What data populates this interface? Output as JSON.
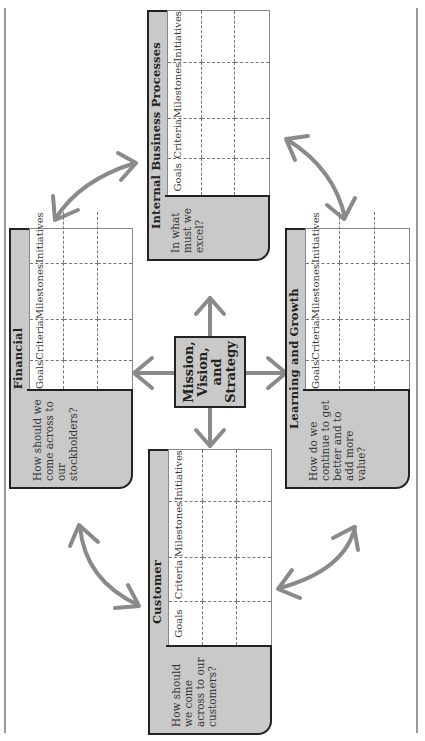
{
  "center": {
    "lines": [
      "Mission,",
      "Vision,",
      "and",
      "Strategy"
    ]
  },
  "columns": [
    "Goals",
    "Criteria",
    "Milestones",
    "Initiatives"
  ],
  "panels": {
    "ibp": {
      "title": "Internal Business Processes",
      "question": "In what must we excel?"
    },
    "financial": {
      "title": "Financial",
      "question": "How should we come across to our stockholders?"
    },
    "learning": {
      "title": "Learning and Growth",
      "question": "How do we continue to get better and to add more value?"
    },
    "customer": {
      "title": "Customer",
      "question": "How should we come across to our customers?"
    }
  },
  "colors": {
    "panel_fill": "#c9c9c9",
    "arrow": "#8a8a8a",
    "border": "#222222"
  }
}
